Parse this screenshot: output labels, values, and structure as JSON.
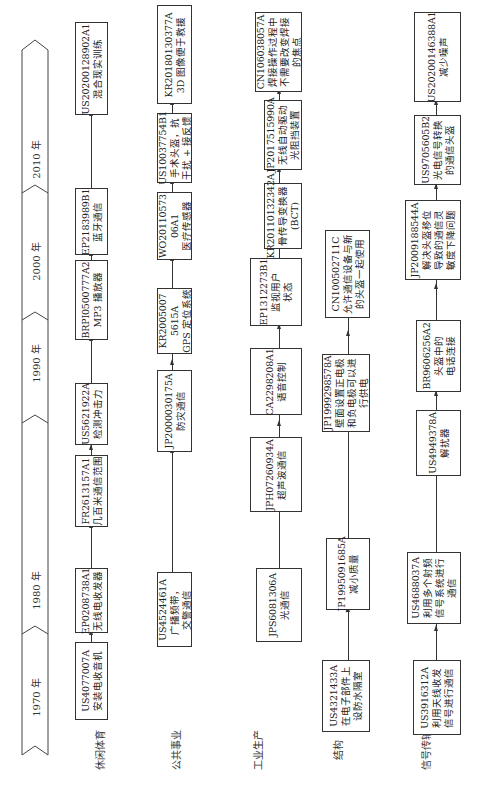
{
  "timeline": {
    "eras": [
      {
        "label": "1970 年"
      },
      {
        "label": "1980 年"
      },
      {
        "label": "1990 年"
      },
      {
        "label": "2000 年"
      },
      {
        "label": "2010 年"
      }
    ]
  },
  "rows": [
    {
      "label": "休闲体育",
      "boxes": [
        {
          "id": "US4077007A",
          "desc": "安装电收音机"
        },
        {
          "id": "EP0208738A1",
          "desc": "无线电收发器"
        },
        {
          "id": "FR2613157A1",
          "desc": "几百米通信范围"
        },
        {
          "id": "US5621922A",
          "desc": "检测冲击力"
        },
        {
          "id": "BRPI0500777A2",
          "desc": "MP3 播放器"
        },
        {
          "id": "EP2183989B1",
          "desc": "蓝牙通信"
        },
        {
          "id": "US20200128902A1",
          "desc": "混合现实训练"
        }
      ]
    },
    {
      "label": "公共事业",
      "boxes": [
        {
          "id": "US4524461A",
          "desc": "广播频带，",
          "desc2": "交警通信"
        },
        {
          "id": "JP2000030175A",
          "desc": "防灾通信"
        },
        {
          "id": "KR2005007",
          "id2": "5615A",
          "desc": "GPS 定位系统"
        },
        {
          "id": "WO20110573",
          "id2": "06A1",
          "desc": "医疗传感器"
        },
        {
          "id": "US10037754B1",
          "desc": "手术头盔，抗",
          "desc2": "干扰 + 接反馈"
        },
        {
          "id": "KR20180130377A",
          "desc": "3D 图像便于救援"
        }
      ]
    },
    {
      "label": "工业生产",
      "boxes": [
        {
          "id": "JPS6081306A",
          "desc": "光通信"
        },
        {
          "id": "JPH07260934A",
          "desc": "超声波通信"
        },
        {
          "id": "CA2298208A1",
          "desc": "语音控制"
        },
        {
          "id": "EP1312273B1",
          "desc": "监视用户",
          "desc2": "状态"
        },
        {
          "id": "KR20110132342A",
          "desc": "骨传导变换器",
          "desc2": "(BCT)"
        },
        {
          "id": "JP2017515990A",
          "desc": "无线自动驱动",
          "desc2": "光阻挡装置"
        },
        {
          "id": "CN106038057A",
          "desc": "焊接操作过程中",
          "desc2": "不需要改变焊接",
          "desc3": "的焦点"
        }
      ]
    },
    {
      "label": "结构",
      "boxes": [
        {
          "id": "US4321433A",
          "desc": "在电子部件上",
          "desc2": "设防水隔室"
        },
        {
          "id": "JP1995091685A",
          "desc": "减小质量"
        },
        {
          "id": "JP1999298578A",
          "desc": "壁面设置正电极",
          "desc2": "和负电极可以进",
          "desc3": "行供电"
        },
        {
          "id": "CN100502711C",
          "desc": "允许通信设备与新",
          "desc2": "的头盔一起使用"
        }
      ]
    },
    {
      "label": "信号传输",
      "boxes": [
        {
          "id": "US3916312A",
          "desc": "利用天线收发",
          "desc2": "信号进行通信"
        },
        {
          "id": "US4688037A",
          "desc": "利用多个射频",
          "desc2": "信号系统进行",
          "desc3": "通信"
        },
        {
          "id": "US4949378A",
          "desc": "解扰器"
        },
        {
          "id": "BR9606256A2",
          "desc": "头盔中的",
          "desc2": "电话连接"
        },
        {
          "id": "JP2009188544A",
          "desc": "解决头盔移位",
          "desc2": "导致的通信灵",
          "desc3": "敏度下降问题"
        },
        {
          "id": "US9705605B2",
          "desc": "光电信号转换",
          "desc2": "的通信头盔"
        },
        {
          "id": "US20200146388A1",
          "desc": "减少噪声"
        }
      ]
    }
  ]
}
